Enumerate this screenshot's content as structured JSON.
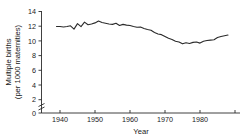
{
  "chart_data": {
    "type": "line",
    "title": "",
    "xlabel": "Year",
    "ylabel": "Multiple births (per 1000 maternities)",
    "ylabel_line1": "Multiple births",
    "ylabel_line2": "(per 1000 maternities)",
    "xlim": [
      1936,
      1990
    ],
    "ylim": [
      0,
      14
    ],
    "y_axis_break": true,
    "y_axis_break_between": [
      0,
      4
    ],
    "grid": false,
    "legend": null,
    "ytick_labels": [
      "0",
      "2",
      "4",
      "6",
      "8",
      "10",
      "12",
      "14"
    ],
    "ytick_values": [
      0,
      2,
      4,
      6,
      8,
      10,
      12,
      14
    ],
    "xtick_labels": [
      "1940",
      "1950",
      "1960",
      "1970",
      "1980"
    ],
    "xtick_values": [
      1940,
      1950,
      1960,
      1970,
      1980
    ],
    "series_name": "Multiple birth rate",
    "line_color": "#2b2b2b",
    "x": [
      1939,
      1940,
      1941,
      1942,
      1943,
      1944,
      1945,
      1946,
      1947,
      1948,
      1949,
      1950,
      1951,
      1952,
      1953,
      1954,
      1955,
      1956,
      1957,
      1958,
      1959,
      1960,
      1961,
      1962,
      1963,
      1964,
      1965,
      1966,
      1967,
      1968,
      1969,
      1970,
      1971,
      1972,
      1973,
      1974,
      1975,
      1976,
      1977,
      1978,
      1979,
      1980,
      1981,
      1982,
      1983,
      1984,
      1985,
      1986,
      1987,
      1988
    ],
    "values": [
      11.95,
      11.95,
      11.9,
      11.95,
      12.05,
      11.6,
      12.35,
      11.95,
      12.55,
      12.2,
      12.3,
      12.45,
      12.7,
      12.5,
      12.4,
      12.3,
      12.25,
      12.4,
      12.1,
      12.25,
      12.15,
      12.1,
      11.95,
      11.85,
      11.9,
      11.7,
      11.55,
      11.45,
      11.15,
      10.95,
      10.85,
      10.6,
      10.35,
      10.2,
      9.95,
      9.85,
      9.6,
      9.75,
      9.65,
      9.8,
      9.85,
      9.7,
      9.95,
      10.05,
      10.1,
      10.15,
      10.45,
      10.6,
      10.7,
      10.8
    ]
  }
}
